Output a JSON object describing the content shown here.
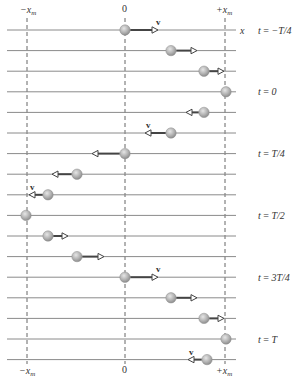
{
  "axis": {
    "top_labels": {
      "neg": "−x",
      "neg_sub": "m",
      "zero": "0",
      "pos": "+x",
      "pos_sub": "m"
    },
    "bottom_labels": {
      "neg": "−x",
      "neg_sub": "m",
      "zero": "0",
      "pos": "+x",
      "pos_sub": "m"
    },
    "axis_name": "x",
    "velocity_label": "v"
  },
  "geometry": {
    "x_neg": 27,
    "x_zero": 125,
    "x_pos": 225,
    "line_start": 7,
    "line_end": 236,
    "row_y0": 30,
    "row_spacing": 20.6,
    "ball_r": 5.2
  },
  "colors": {
    "line": "#8a8a8a",
    "dashed": "#555555",
    "ball": "#b5b5b5",
    "ball_edge": "#8c8c8c",
    "arrow": "#444444",
    "text": "#333333"
  },
  "rows": [
    {
      "ball": 125,
      "arrow_to": 158,
      "v": true,
      "label": "t = −T/4"
    },
    {
      "ball": 171,
      "arrow_to": 197,
      "v": false,
      "label": ""
    },
    {
      "ball": 204,
      "arrow_to": 224,
      "v": false,
      "label": ""
    },
    {
      "ball": 226,
      "arrow_to": null,
      "v": false,
      "label": "t = 0"
    },
    {
      "ball": 204,
      "arrow_to": 186,
      "v": false,
      "label": ""
    },
    {
      "ball": 171,
      "arrow_to": 145,
      "v": true,
      "label": ""
    },
    {
      "ball": 125,
      "arrow_to": 92,
      "v": false,
      "label": "t = T/4"
    },
    {
      "ball": 77,
      "arrow_to": 52,
      "v": false,
      "label": ""
    },
    {
      "ball": 48,
      "arrow_to": 29,
      "v": true,
      "label": ""
    },
    {
      "ball": 26,
      "arrow_to": null,
      "v": false,
      "label": "t = T/2"
    },
    {
      "ball": 48,
      "arrow_to": 68,
      "v": false,
      "label": ""
    },
    {
      "ball": 77,
      "arrow_to": 104,
      "v": false,
      "label": ""
    },
    {
      "ball": 125,
      "arrow_to": 158,
      "v": true,
      "label": "t = 3T/4"
    },
    {
      "ball": 171,
      "arrow_to": 197,
      "v": false,
      "label": ""
    },
    {
      "ball": 204,
      "arrow_to": 224,
      "v": false,
      "label": ""
    },
    {
      "ball": 226,
      "arrow_to": null,
      "v": false,
      "label": "t = T"
    },
    {
      "ball": 207,
      "arrow_to": 188,
      "v": true,
      "label": ""
    }
  ]
}
